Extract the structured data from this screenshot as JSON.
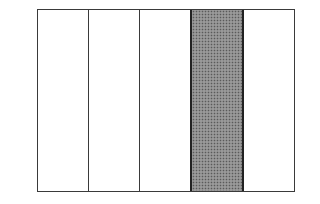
{
  "diagram": {
    "type": "fraction-bar",
    "total_parts": 5,
    "shaded_parts": [
      4
    ],
    "shaded_count": 1,
    "fraction": "1/5",
    "colors": {
      "outline": "#3a3a3a",
      "shaded_fill": "#8a8a8a",
      "unshaded_fill": "#ffffff"
    },
    "parts": [
      {
        "index": 1,
        "shaded": false
      },
      {
        "index": 2,
        "shaded": false
      },
      {
        "index": 3,
        "shaded": false
      },
      {
        "index": 4,
        "shaded": true
      },
      {
        "index": 5,
        "shaded": false
      }
    ]
  }
}
